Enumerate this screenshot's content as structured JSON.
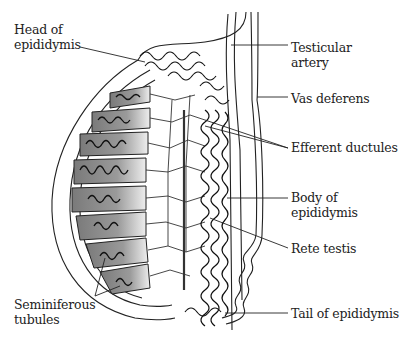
{
  "diagram": {
    "colors": {
      "line": "#222222",
      "lobule_fill": "#8a8a8a",
      "lobule_light": "#e6e6e6",
      "background": "#ffffff"
    },
    "labels": [
      {
        "id": "head",
        "text": "Head of\nepididymis",
        "x": 14,
        "y": 22
      },
      {
        "id": "artery",
        "text": "Testicular\nartery",
        "x": 291,
        "y": 40
      },
      {
        "id": "vas",
        "text": "Vas deferens",
        "x": 291,
        "y": 91
      },
      {
        "id": "efferent",
        "text": "Efferent ductules",
        "x": 291,
        "y": 140
      },
      {
        "id": "body",
        "text": "Body of\nepididymis",
        "x": 291,
        "y": 190
      },
      {
        "id": "rete",
        "text": "Rete testis",
        "x": 291,
        "y": 241
      },
      {
        "id": "tail",
        "text": "Tail of epididymis",
        "x": 291,
        "y": 306
      },
      {
        "id": "semi",
        "text": "Seminiferous\ntubules",
        "x": 14,
        "y": 297
      }
    ]
  }
}
